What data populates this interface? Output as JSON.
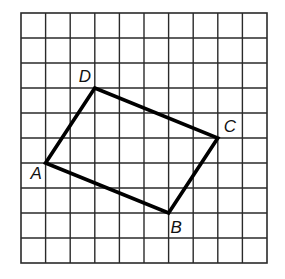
{
  "figure": {
    "type": "quadrilateral-on-grid",
    "grid": {
      "columns": 10,
      "rows": 10,
      "origin_px": [
        21,
        13
      ],
      "cell_w": 24.6,
      "cell_h": 25,
      "line_color": "#2a2a2a"
    },
    "shape": {
      "name": "rectangle ABCD",
      "stroke_color": "#000000",
      "vertices": [
        {
          "label": "A",
          "col": 1,
          "row": 6,
          "label_offset": [
            -15,
            16
          ]
        },
        {
          "label": "B",
          "col": 6,
          "row": 8,
          "label_offset": [
            2,
            20
          ]
        },
        {
          "label": "C",
          "col": 8,
          "row": 5,
          "label_offset": [
            6,
            -6
          ]
        },
        {
          "label": "D",
          "col": 3,
          "row": 3,
          "label_offset": [
            -16,
            -6
          ]
        }
      ]
    }
  }
}
